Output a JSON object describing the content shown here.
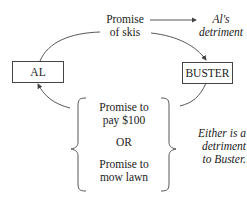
{
  "diagram": {
    "nodes": {
      "al": "AL",
      "buster": "BUSTER"
    },
    "top_promise": {
      "line1": "Promise",
      "line2": "of skis"
    },
    "al_detriment": {
      "line1": "Al's",
      "line2": "detriment"
    },
    "bottom_options": {
      "option1_line1": "Promise to",
      "option1_line2": "pay $100",
      "or": "OR",
      "option2_line1": "Promise to",
      "option2_line2": "mow lawn"
    },
    "buster_note": {
      "line1": "Either is a",
      "line2": "detriment",
      "line3": "to Buster."
    },
    "colors": {
      "line": "#444444",
      "text": "#222222"
    }
  }
}
